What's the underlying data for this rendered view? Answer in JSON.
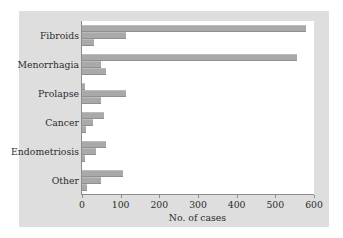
{
  "chart_data": {
    "type": "bar",
    "orientation": "horizontal",
    "title": "",
    "xlabel": "No. of cases",
    "ylabel": "",
    "xlim": [
      0,
      600
    ],
    "xticks": [
      0,
      100,
      200,
      300,
      400,
      500,
      600
    ],
    "xtick_labels": [
      "0",
      "100",
      "200",
      "300",
      "400",
      "500",
      "600"
    ],
    "grid": false,
    "legend": "none",
    "categories": [
      "Fibroids",
      "Menorrhagia",
      "Prolapse",
      "Cancer",
      "Endometriosis",
      "Other"
    ],
    "series": [
      {
        "name": "series-1",
        "values": [
          580,
          555,
          8,
          58,
          62,
          105
        ]
      },
      {
        "name": "series-2",
        "values": [
          115,
          48,
          115,
          28,
          35,
          50
        ]
      },
      {
        "name": "series-3",
        "values": [
          30,
          62,
          48,
          10,
          8,
          12
        ]
      }
    ],
    "bar_color": "#a9a9a9",
    "panel_color": "#dedede",
    "plot_color": "#ffffff",
    "axis_color": "#8c8c8c"
  }
}
